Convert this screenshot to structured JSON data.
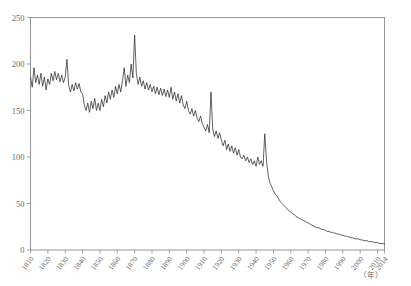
{
  "figure": {
    "ghost_header_text": "",
    "unit_label": "（年）"
  },
  "chart_data": {
    "type": "line",
    "title": "",
    "xlabel": "（年）",
    "ylabel": "",
    "xlim": [
      1810,
      2014
    ],
    "ylim": [
      0,
      250
    ],
    "grid": false,
    "legend": null,
    "line_color": "#2b2b2b",
    "axis_color": "#8a8a8a",
    "y_ticks": [
      0,
      50,
      100,
      150,
      200,
      250
    ],
    "x_ticks": [
      1810,
      1820,
      1830,
      1840,
      1850,
      1860,
      1870,
      1880,
      1890,
      1900,
      1910,
      1920,
      1930,
      1940,
      1950,
      1960,
      1970,
      1980,
      1990,
      2000,
      2010,
      2014
    ],
    "x_tick_labels": [
      "1810",
      "1820",
      "1830",
      "1840",
      "1850",
      "1860",
      "1870",
      "1880",
      "1890",
      "1900",
      "1910",
      "1920",
      "1930",
      "1940",
      "1950",
      "1960",
      "1970",
      "1980",
      "1990",
      "2000",
      "2010",
      "2014"
    ],
    "y_tick_labels": [
      "0",
      "50",
      "100",
      "150",
      "200",
      "250"
    ],
    "series": [
      {
        "name": "series-1",
        "x": [
          1810,
          1811,
          1812,
          1813,
          1814,
          1815,
          1816,
          1817,
          1818,
          1819,
          1820,
          1821,
          1822,
          1823,
          1824,
          1825,
          1826,
          1827,
          1828,
          1829,
          1830,
          1831,
          1832,
          1833,
          1834,
          1835,
          1836,
          1837,
          1838,
          1839,
          1840,
          1841,
          1842,
          1843,
          1844,
          1845,
          1846,
          1847,
          1848,
          1849,
          1850,
          1851,
          1852,
          1853,
          1854,
          1855,
          1856,
          1857,
          1858,
          1859,
          1860,
          1861,
          1862,
          1863,
          1864,
          1865,
          1866,
          1867,
          1868,
          1869,
          1870,
          1871,
          1872,
          1873,
          1874,
          1875,
          1876,
          1877,
          1878,
          1879,
          1880,
          1881,
          1882,
          1883,
          1884,
          1885,
          1886,
          1887,
          1888,
          1889,
          1890,
          1891,
          1892,
          1893,
          1894,
          1895,
          1896,
          1897,
          1898,
          1899,
          1900,
          1901,
          1902,
          1903,
          1904,
          1905,
          1906,
          1907,
          1908,
          1909,
          1910,
          1911,
          1912,
          1913,
          1914,
          1915,
          1916,
          1917,
          1918,
          1919,
          1920,
          1921,
          1922,
          1923,
          1924,
          1925,
          1926,
          1927,
          1928,
          1929,
          1930,
          1931,
          1932,
          1933,
          1934,
          1935,
          1936,
          1937,
          1938,
          1939,
          1940,
          1941,
          1942,
          1943,
          1944,
          1945,
          1946,
          1947,
          1948,
          1949,
          1950,
          1951,
          1952,
          1953,
          1954,
          1955,
          1956,
          1957,
          1958,
          1959,
          1960,
          1961,
          1962,
          1963,
          1964,
          1965,
          1966,
          1967,
          1968,
          1969,
          1970,
          1971,
          1972,
          1973,
          1974,
          1975,
          1976,
          1977,
          1978,
          1979,
          1980,
          1981,
          1982,
          1983,
          1984,
          1985,
          1986,
          1987,
          1988,
          1989,
          1990,
          1991,
          1992,
          1993,
          1994,
          1995,
          1996,
          1997,
          1998,
          1999,
          2000,
          2001,
          2002,
          2003,
          2004,
          2005,
          2006,
          2007,
          2008,
          2009,
          2010,
          2011,
          2012,
          2013,
          2014
        ],
        "values": [
          186,
          175,
          196,
          180,
          188,
          178,
          190,
          176,
          186,
          172,
          184,
          178,
          190,
          182,
          192,
          183,
          190,
          181,
          188,
          180,
          186,
          205,
          177,
          170,
          178,
          171,
          180,
          173,
          179,
          170,
          168,
          156,
          150,
          158,
          148,
          160,
          152,
          163,
          150,
          158,
          150,
          162,
          154,
          166,
          158,
          170,
          162,
          172,
          164,
          176,
          168,
          178,
          170,
          182,
          196,
          176,
          188,
          180,
          200,
          185,
          231,
          190,
          178,
          186,
          176,
          182,
          173,
          180,
          172,
          178,
          170,
          176,
          168,
          175,
          167,
          174,
          166,
          173,
          165,
          172,
          164,
          175,
          162,
          170,
          160,
          168,
          158,
          166,
          156,
          152,
          160,
          150,
          146,
          152,
          144,
          150,
          142,
          138,
          144,
          136,
          132,
          128,
          135,
          126,
          170,
          130,
          122,
          128,
          120,
          126,
          118,
          112,
          118,
          108,
          114,
          106,
          112,
          104,
          110,
          102,
          108,
          100,
          98,
          102,
          96,
          100,
          94,
          98,
          92,
          96,
          90,
          100,
          92,
          96,
          90,
          125,
          96,
          80,
          72,
          68,
          64,
          60,
          58,
          55,
          52,
          50,
          48,
          46,
          44,
          42,
          41,
          39,
          38,
          36,
          35,
          34,
          33,
          32,
          31,
          30,
          29,
          28,
          27,
          26,
          25,
          24,
          24,
          23,
          22,
          22,
          21,
          20,
          20,
          19,
          19,
          18,
          18,
          17,
          17,
          16,
          16,
          15,
          15,
          14,
          14,
          13,
          13,
          12,
          12,
          12,
          11,
          11,
          10,
          10,
          10,
          9,
          9,
          9,
          8,
          8,
          8,
          7,
          7,
          7,
          6
        ]
      }
    ]
  }
}
